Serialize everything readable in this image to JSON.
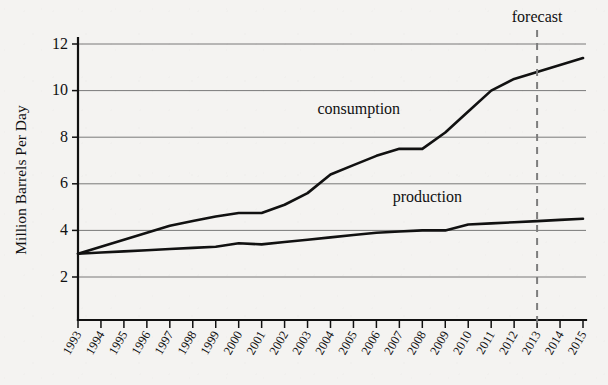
{
  "chart_data": {
    "type": "line",
    "title": "",
    "xlabel": "",
    "ylabel": "Million Barrels Per Day",
    "xlim": [
      1993,
      2015
    ],
    "ylim": [
      0,
      12.6
    ],
    "grid": true,
    "legend_position": "inline-annotation",
    "y_ticks": [
      2,
      4,
      6,
      8,
      10,
      12
    ],
    "x": [
      1993,
      1994,
      1995,
      1996,
      1997,
      1998,
      1999,
      2000,
      2001,
      2002,
      2003,
      2004,
      2005,
      2006,
      2007,
      2008,
      2009,
      2010,
      2011,
      2012,
      2013,
      2014,
      2015
    ],
    "categories": [
      "1993",
      "1994",
      "1995",
      "1996",
      "1997",
      "1998",
      "1999",
      "2000",
      "2001",
      "2002",
      "2003",
      "2004",
      "2005",
      "2006",
      "2007",
      "2008",
      "2009",
      "2010",
      "2011",
      "2012",
      "2013",
      "2014",
      "2015"
    ],
    "series": [
      {
        "name": "consumption",
        "values": [
          3.0,
          3.3,
          3.6,
          3.9,
          4.2,
          4.4,
          4.6,
          4.75,
          4.75,
          5.1,
          5.6,
          6.4,
          6.8,
          7.2,
          7.5,
          7.5,
          8.2,
          9.1,
          10.0,
          10.5,
          10.8,
          11.1,
          11.4
        ]
      },
      {
        "name": "production",
        "values": [
          3.0,
          3.05,
          3.1,
          3.15,
          3.2,
          3.25,
          3.3,
          3.45,
          3.4,
          3.5,
          3.6,
          3.7,
          3.8,
          3.9,
          3.95,
          4.0,
          4.0,
          4.25,
          4.3,
          4.35,
          4.4,
          4.45,
          4.5
        ]
      }
    ],
    "annotations": [
      {
        "text": "consumption",
        "x": 2005,
        "y": 9.0
      },
      {
        "text": "production",
        "x": 2008.8,
        "y": 5.2
      },
      {
        "text": "forecast",
        "x": 2013,
        "y": 12.9
      }
    ],
    "forecast_marker": {
      "label": "forecast",
      "x": 2013,
      "style": "dashed-vertical"
    },
    "colors": {
      "line": "#111111",
      "gridline": "#6b6b6b",
      "axis": "#111111",
      "forecast": "#7d7d7d",
      "background": "#f4f3f1"
    }
  }
}
